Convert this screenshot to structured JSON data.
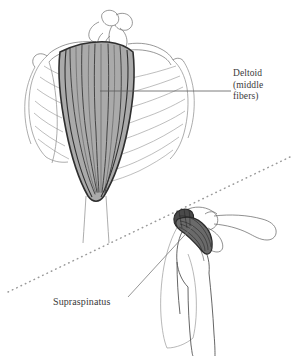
{
  "figure": {
    "kind": "anatomical-illustration",
    "background_color": "#ffffff",
    "ink_color": "#3a3a3a",
    "line_color_light": "#8a8a8a",
    "panels": [
      {
        "name": "posterior-shoulder-panel",
        "description": "posterior view of thorax, scapula and shaded deltoid muscle",
        "highlight_color": "#aaaaaa"
      },
      {
        "name": "anterior-shoulder-panel",
        "description": "anterior view of glenohumeral joint with shaded supraspinatus tendon",
        "highlight_color": "#6a6a6a"
      }
    ],
    "divider": {
      "name": "dotted-diagonal-divider",
      "style": "dotted",
      "color": "#9a9a9a"
    }
  },
  "labels": {
    "deltoid": {
      "line1": "Deltoid",
      "line2": "(middle",
      "line3": "fibers)"
    },
    "supraspinatus": {
      "text": "Supraspinatus"
    }
  }
}
